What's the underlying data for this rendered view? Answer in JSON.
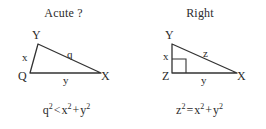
{
  "figure": {
    "background_color": "#ffffff",
    "stroke_color": "#333333"
  },
  "panels": [
    {
      "id": "acute",
      "title": "Acute ?",
      "triangle": {
        "vertices": [
          {
            "name": "Y",
            "label": "Y",
            "x": 38,
            "y": 14
          },
          {
            "name": "Q",
            "label": "Q",
            "x": 30,
            "y": 43
          },
          {
            "name": "X",
            "label": "X",
            "x": 101,
            "y": 43
          }
        ],
        "side_labels": [
          {
            "name": "x",
            "label": "x"
          },
          {
            "name": "q",
            "label": "q"
          },
          {
            "name": "y",
            "label": "y"
          }
        ],
        "has_right_angle_mark": false
      },
      "formula": {
        "lhs_base": "q",
        "lhs_exp": "2",
        "operator": "<",
        "rhs_first_base": "x",
        "rhs_first_exp": "2",
        "rhs_plus": "+",
        "rhs_second_base": "y",
        "rhs_second_exp": "2",
        "text": "q2 < x2 + y2"
      }
    },
    {
      "id": "right",
      "title": "Right",
      "triangle": {
        "vertices": [
          {
            "name": "Y",
            "label": "Y",
            "x": 39,
            "y": 14
          },
          {
            "name": "Z",
            "label": "Z",
            "x": 39,
            "y": 43
          },
          {
            "name": "X",
            "label": "X",
            "x": 104,
            "y": 43
          }
        ],
        "side_labels": [
          {
            "name": "x",
            "label": "x"
          },
          {
            "name": "z",
            "label": "z"
          },
          {
            "name": "y",
            "label": "y"
          }
        ],
        "has_right_angle_mark": true
      },
      "formula": {
        "lhs_base": "z",
        "lhs_exp": "2",
        "operator": "=",
        "rhs_first_base": "x",
        "rhs_first_exp": "2",
        "rhs_plus": "+",
        "rhs_second_base": "y",
        "rhs_second_exp": "2",
        "text": "z2 = x2 + y2"
      }
    }
  ]
}
